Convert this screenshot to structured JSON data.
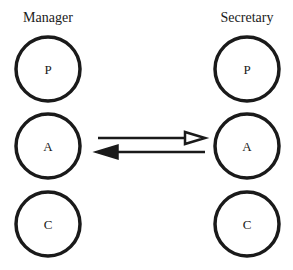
{
  "columns": [
    {
      "title": "Manager",
      "nodes": [
        {
          "label": "P"
        },
        {
          "label": "A"
        },
        {
          "label": "C"
        }
      ]
    },
    {
      "title": "Secretary",
      "nodes": [
        {
          "label": "P"
        },
        {
          "label": "A"
        },
        {
          "label": "C"
        }
      ]
    }
  ],
  "arrows": [
    {
      "from": "Manager.A",
      "to": "Secretary.A",
      "head": "hollow"
    },
    {
      "from": "Secretary.A",
      "to": "Manager.A",
      "head": "filled"
    }
  ],
  "colors": {
    "stroke": "#1a1a1a",
    "background": "#ffffff"
  }
}
